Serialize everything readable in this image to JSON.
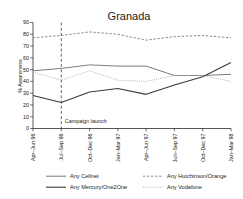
{
  "chart_data": {
    "type": "line",
    "title": "Granada",
    "xlabel": "",
    "ylabel": "% Awareness",
    "ylim": [
      0,
      90
    ],
    "yticks": [
      0,
      10,
      20,
      30,
      40,
      50,
      60,
      70,
      80,
      90
    ],
    "grid": false,
    "legend_position": "bottom",
    "categories": [
      "Apr–Jun 96",
      "Jul–Sep 96",
      "Oct–Dec 96",
      "Jan–Mar 97",
      "Apr–Jun 97",
      "Jun–Sep 97",
      "Oct–Dec 97",
      "Jan–Mar 98"
    ],
    "series": [
      {
        "name": "Any Cellnet",
        "color": "#6e6e6e",
        "dash": "none",
        "width": 0.9,
        "values": [
          49,
          51,
          54,
          53,
          53,
          45,
          45,
          46
        ]
      },
      {
        "name": "Any Hutchinson/Orange",
        "color": "#7a7a7a",
        "dash": "dashed",
        "width": 0.9,
        "values": [
          77,
          79,
          82,
          80,
          75,
          78,
          79,
          77
        ]
      },
      {
        "name": "Any Mercury/One2One",
        "color": "#3a3a3a",
        "dash": "none",
        "width": 1.1,
        "values": [
          28,
          22,
          31,
          34,
          29,
          37,
          44,
          56
        ]
      },
      {
        "name": "Any Vodafone",
        "color": "#a8a8a8",
        "dash": "dotted",
        "width": 0.9,
        "values": [
          48,
          41,
          49,
          41,
          40,
          45,
          45,
          40
        ]
      }
    ],
    "annotations": [
      {
        "text": "Campaign launch",
        "at_category": "Jul–Sep 96",
        "style": "vertical-dashed-line"
      }
    ]
  },
  "legend": {
    "entries": [
      {
        "label": "Any Cellnet"
      },
      {
        "label": "Any Hutchinson/Orange"
      },
      {
        "label": "Any Mercury/One2One"
      },
      {
        "label": "Any Vodafone"
      }
    ]
  }
}
